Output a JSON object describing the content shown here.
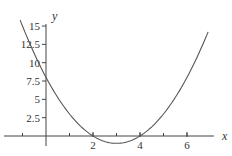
{
  "chart_data": {
    "type": "line",
    "title": "",
    "xlabel": "x",
    "ylabel": "y",
    "xlim": [
      -1.3,
      7.3
    ],
    "ylim": [
      -1.5,
      16.5
    ],
    "grid": false,
    "legend": null,
    "x_ticks": [
      -1,
      1,
      2,
      3,
      4,
      5,
      6
    ],
    "x_tick_labels": [
      {
        "value": 2,
        "label": "2"
      },
      {
        "value": 4,
        "label": "4"
      },
      {
        "value": 6,
        "label": "6"
      }
    ],
    "y_tick_labels": [
      {
        "value": 2.5,
        "label": "2.5"
      },
      {
        "value": 5,
        "label": "5"
      },
      {
        "value": 7.5,
        "label": "7.5"
      },
      {
        "value": 10,
        "label": "10"
      },
      {
        "value": 12.5,
        "label": "12.5"
      },
      {
        "value": 15,
        "label": "15"
      }
    ],
    "series": [
      {
        "name": "y = (x - 3)^2 - 1",
        "x": [
          -1.1,
          -0.5,
          0,
          0.5,
          1,
          1.5,
          2,
          2.5,
          3,
          3.5,
          4,
          4.5,
          5,
          5.5,
          6,
          6.5,
          6.9
        ],
        "values": [
          15.81,
          11.25,
          8,
          5.25,
          3,
          1.25,
          0,
          -0.75,
          -1,
          -0.75,
          0,
          1.25,
          3,
          5.25,
          8,
          11.25,
          14.21
        ]
      }
    ],
    "annotations": []
  },
  "colors": {
    "curve": "#555555",
    "axes": "#444444",
    "background": "#ffffff"
  }
}
